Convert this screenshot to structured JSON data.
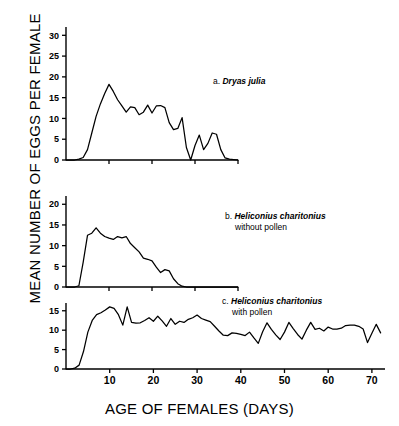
{
  "figure": {
    "ylabel": "MEAN NUMBER OF EGGS PER FEMALE",
    "xlabel": "AGE OF FEMALES (DAYS)"
  },
  "panels": {
    "a": {
      "letter": "a.",
      "species": "Dryas julia",
      "note": ""
    },
    "b": {
      "letter": "b.",
      "species": "Heliconius charitonius",
      "note": "without pollen"
    },
    "c": {
      "letter": "c.",
      "species": "Heliconius charitonius",
      "note": "with pollen"
    }
  },
  "axis_labels": {
    "a_y": [
      "0",
      "5",
      "10",
      "15",
      "20",
      "25",
      "30"
    ],
    "b_y": [
      "0",
      "5",
      "10",
      "15",
      "20"
    ],
    "c_y": [
      "0",
      "5",
      "10",
      "15"
    ],
    "c_x": [
      "10",
      "20",
      "30",
      "40",
      "50",
      "60",
      "70"
    ]
  },
  "chart_data": {
    "type": "line",
    "title": "",
    "xlabel": "AGE OF FEMALES (DAYS)",
    "ylabel": "MEAN NUMBER OF EGGS PER FEMALE",
    "grid": false,
    "legend": "none",
    "panels": [
      {
        "id": "a",
        "label": "a. Dryas julia",
        "xlim": [
          0,
          40
        ],
        "ylim": [
          0,
          32
        ],
        "yticks": [
          0,
          5,
          10,
          15,
          20,
          25,
          30
        ],
        "xticks": [
          10,
          20,
          30,
          40
        ],
        "xtick_labels_shown": false,
        "x": [
          0,
          1,
          2,
          3,
          4,
          5,
          6,
          7,
          8,
          9,
          10,
          11,
          12,
          13,
          14,
          15,
          16,
          17,
          18,
          19,
          20,
          21,
          22,
          23,
          24,
          25,
          26,
          27,
          28,
          29,
          30,
          31,
          32,
          33,
          34,
          35,
          36,
          37,
          38,
          40
        ],
        "y": [
          0,
          0,
          0,
          0.2,
          0.6,
          2.5,
          6.5,
          10.5,
          13.5,
          16.0,
          18.2,
          16.5,
          14.5,
          13.0,
          11.5,
          12.8,
          12.6,
          10.9,
          11.5,
          13.2,
          11.3,
          13.0,
          13.1,
          12.6,
          9.0,
          7.3,
          7.6,
          10.2,
          3.0,
          0,
          3.5,
          6.0,
          2.5,
          4.0,
          6.5,
          6.2,
          2.5,
          0.5,
          0.2,
          0
        ]
      },
      {
        "id": "b",
        "label": "b. Heliconius charitonius without pollen",
        "xlim": [
          0,
          40
        ],
        "ylim": [
          0,
          22
        ],
        "yticks": [
          0,
          5,
          10,
          15,
          20
        ],
        "xticks": [
          10,
          20,
          30,
          40
        ],
        "xtick_labels_shown": false,
        "x": [
          0,
          1,
          2,
          3,
          4,
          5,
          6,
          7,
          8,
          9,
          10,
          11,
          12,
          13,
          14,
          15,
          16,
          17,
          18,
          19,
          20,
          21,
          22,
          23,
          24,
          25,
          26,
          27,
          28,
          40
        ],
        "y": [
          0,
          0,
          0,
          0.3,
          6.0,
          12.5,
          13.0,
          14.3,
          13.0,
          12.2,
          11.8,
          11.5,
          12.2,
          11.9,
          12.2,
          10.5,
          9.5,
          8.5,
          7.0,
          6.7,
          6.3,
          4.8,
          3.5,
          4.2,
          3.9,
          2.0,
          0.8,
          0.2,
          0,
          0
        ]
      },
      {
        "id": "c",
        "label": "c. Heliconius charitonius with pollen",
        "xlim": [
          0,
          73
        ],
        "ylim": [
          0,
          17
        ],
        "yticks": [
          0,
          5,
          10,
          15
        ],
        "xticks": [
          10,
          20,
          30,
          40,
          50,
          60,
          70
        ],
        "xtick_labels_shown": true,
        "x": [
          0,
          1,
          2,
          3,
          4,
          5,
          6,
          7,
          8,
          9,
          10,
          11,
          12,
          13,
          14,
          15,
          16,
          17,
          18,
          19,
          20,
          21,
          22,
          23,
          24,
          25,
          26,
          27,
          28,
          29,
          30,
          31,
          32,
          33,
          34,
          35,
          36,
          37,
          38,
          39,
          40,
          41,
          42,
          43,
          44,
          45,
          46,
          47,
          48,
          49,
          50,
          51,
          52,
          53,
          54,
          55,
          56,
          57,
          58,
          59,
          60,
          61,
          62,
          63,
          64,
          65,
          66,
          67,
          68,
          69,
          70,
          71,
          72
        ],
        "y": [
          0,
          0,
          0.2,
          1.0,
          4.5,
          9.5,
          12.5,
          14.0,
          14.5,
          15.2,
          16.0,
          15.6,
          14.0,
          11.3,
          16.0,
          12.0,
          11.8,
          11.9,
          12.5,
          13.2,
          12.3,
          13.6,
          12.4,
          11.0,
          13.0,
          11.5,
          12.3,
          12.0,
          12.8,
          13.2,
          13.9,
          13.0,
          12.6,
          12.2,
          11.0,
          9.8,
          8.7,
          8.6,
          9.3,
          9.2,
          8.9,
          8.6,
          9.5,
          8.0,
          6.6,
          9.6,
          11.9,
          10.2,
          8.8,
          7.6,
          9.5,
          12.0,
          10.4,
          8.9,
          7.7,
          10.0,
          12.0,
          10.2,
          10.5,
          9.8,
          10.8,
          10.3,
          10.3,
          10.5,
          11.2,
          11.3,
          11.3,
          11.0,
          10.3,
          6.8,
          9.2,
          11.5,
          9.3
        ]
      }
    ]
  }
}
